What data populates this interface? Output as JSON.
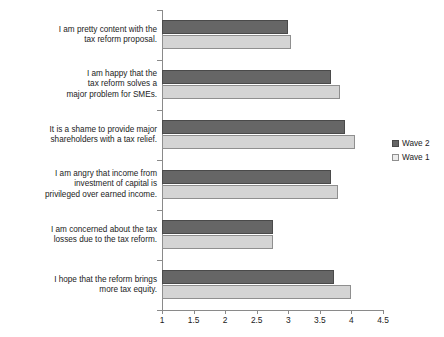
{
  "chart_data": {
    "type": "bar",
    "orientation": "horizontal",
    "title": "",
    "xlabel": "",
    "ylabel": "",
    "xlim": [
      1,
      4.5
    ],
    "grid": false,
    "legend_position": "right",
    "xticks": [
      "1",
      "1.5",
      "2",
      "2.5",
      "3",
      "3.5",
      "4",
      "4.5"
    ],
    "xtick_values": [
      1,
      1.5,
      2,
      2.5,
      3,
      3.5,
      4,
      4.5
    ],
    "categories": [
      "I am pretty content with the\ntax reform proposal.",
      "I am happy that the\ntax reform solves a\nmajor problem for SMEs.",
      "It is a shame to provide major\nshareholders with a tax relief.",
      "I am angry that income from\ninvestment of capital is\nprivileged over earned income.",
      "I am concerned about the tax\nlosses due to the tax reform.",
      "I hope that the reform brings\nmore tax equity."
    ],
    "series": [
      {
        "name": "Wave 2",
        "color": "#666666",
        "values": [
          3.0,
          3.68,
          3.9,
          3.68,
          2.75,
          3.72
        ]
      },
      {
        "name": "Wave 1",
        "color": "#d4d4d4",
        "values": [
          3.05,
          3.82,
          4.05,
          3.78,
          2.75,
          4.0
        ]
      }
    ]
  },
  "legend": {
    "items": [
      {
        "label": "Wave 2"
      },
      {
        "label": "Wave 1"
      }
    ]
  }
}
